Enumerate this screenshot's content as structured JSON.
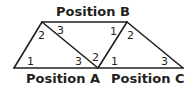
{
  "diagram": {
    "labels": {
      "position_b": "Position B",
      "position_a": "Position A",
      "position_c": "Position C"
    },
    "angles": {
      "a1": "1",
      "a2": "2",
      "a3": "3",
      "b1": "1",
      "b2": "2",
      "b3": "3",
      "c1": "1",
      "c2": "2",
      "c3": "3"
    }
  }
}
